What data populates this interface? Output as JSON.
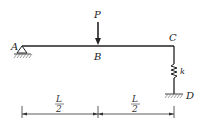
{
  "diagram": {
    "type": "beam-with-spring-support",
    "labels": {
      "A": "A",
      "B": "B",
      "C": "C",
      "D": "D",
      "load": "P",
      "spring": "k"
    },
    "dimensions": [
      {
        "numerator": "L",
        "denominator": "2"
      },
      {
        "numerator": "L",
        "denominator": "2"
      }
    ],
    "colors": {
      "line": "#222222",
      "hatch": "#666666"
    }
  }
}
